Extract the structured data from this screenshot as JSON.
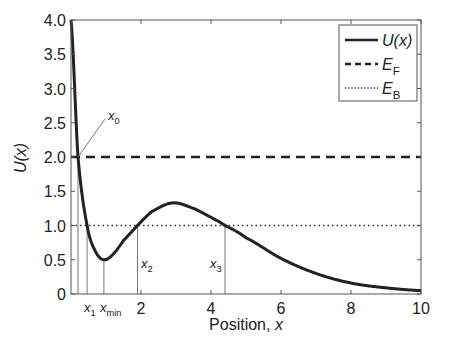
{
  "chart_data": {
    "type": "line",
    "title": "",
    "xlabel": "Position, x",
    "ylabel": "U(x)",
    "xlim": [
      0,
      10
    ],
    "ylim": [
      0,
      4.0
    ],
    "xticks": [
      2,
      4,
      6,
      8,
      10
    ],
    "xtick_labels": [
      "2",
      "4",
      "6",
      "8",
      "10"
    ],
    "yticks": [
      0,
      0.5,
      1.0,
      1.5,
      2.0,
      2.5,
      3.0,
      3.5,
      4.0
    ],
    "ytick_labels": [
      "0",
      "0.5",
      "1.0",
      "1.5",
      "2.0",
      "2.5",
      "3.0",
      "3.5",
      "4.0"
    ],
    "grid": false,
    "legend_position": "upper right",
    "series": [
      {
        "name": "U(x)",
        "style": "solid",
        "x": [
          0,
          0.2,
          0.46,
          0.7,
          0.94,
          1.2,
          1.5,
          1.9,
          2.3,
          2.9,
          3.5,
          4.0,
          4.4,
          5.0,
          6.0,
          7.0,
          8.0,
          9.0,
          10.0
        ],
        "values": [
          4.0,
          2.0,
          1.0,
          0.62,
          0.5,
          0.58,
          0.78,
          1.0,
          1.2,
          1.33,
          1.25,
          1.12,
          1.0,
          0.82,
          0.52,
          0.3,
          0.16,
          0.09,
          0.05
        ]
      },
      {
        "name": "E_F",
        "style": "dashed",
        "x": [
          0,
          10
        ],
        "values": [
          2.0,
          2.0
        ]
      },
      {
        "name": "E_B",
        "style": "dotted",
        "x": [
          0,
          10
        ],
        "values": [
          1.0,
          1.0
        ]
      }
    ],
    "annotations": [
      {
        "label": "x0",
        "x": 0.2,
        "y": 2.0
      },
      {
        "label": "x1",
        "x": 0.46,
        "y": 1.0
      },
      {
        "label": "xmin",
        "x": 0.94,
        "y": 0.5
      },
      {
        "label": "x2",
        "x": 1.9,
        "y": 1.0
      },
      {
        "label": "x3",
        "x": 4.4,
        "y": 1.0
      }
    ]
  },
  "labels": {
    "ylabel": "U(x)",
    "xlabel_main": "Position, ",
    "xlabel_var": "x",
    "legend": [
      {
        "base": "U(x)",
        "sub": ""
      },
      {
        "base": "E",
        "sub": "F"
      },
      {
        "base": "E",
        "sub": "B"
      }
    ],
    "x0": {
      "base": "x",
      "sub": "0"
    },
    "x1": {
      "base": "x",
      "sub": "1"
    },
    "xmin": {
      "base": "x",
      "sub": "min"
    },
    "x2": {
      "base": "x",
      "sub": "2"
    },
    "x3": {
      "base": "x",
      "sub": "3"
    }
  },
  "colors": {
    "curve": "#222222",
    "axis": "#555555",
    "marker_lines": "#777777"
  }
}
